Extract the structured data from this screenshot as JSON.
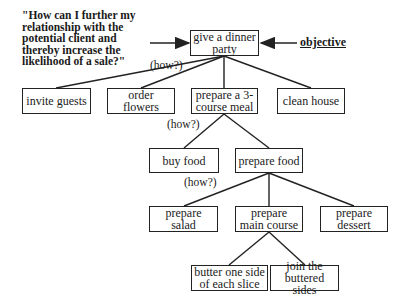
{
  "question": "\"How can I further my relationship with the potential client and thereby increase the likelihood of a sale?\"",
  "objective_label": "objective",
  "how_label": "(how?)",
  "nodes": {
    "root": "give a dinner party",
    "invite": "invite guests",
    "flowers": "order flowers",
    "meal": "prepare a 3-course meal",
    "clean": "clean house",
    "buy": "buy food",
    "prepfood": "prepare food",
    "salad": "prepare salad",
    "main": "prepare main course",
    "dessert": "prepare dessert",
    "butter": "butter one side of each slice",
    "join": "join the buttered sides"
  },
  "edges": [
    [
      "root",
      "invite"
    ],
    [
      "root",
      "flowers"
    ],
    [
      "root",
      "meal"
    ],
    [
      "root",
      "clean"
    ],
    [
      "meal",
      "buy"
    ],
    [
      "meal",
      "prepfood"
    ],
    [
      "prepfood",
      "salad"
    ],
    [
      "prepfood",
      "main"
    ],
    [
      "prepfood",
      "dessert"
    ],
    [
      "main",
      "butter"
    ],
    [
      "main",
      "join"
    ]
  ]
}
